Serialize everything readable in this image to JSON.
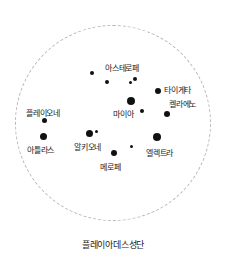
{
  "figure": {
    "caption": "플레이아데스성단",
    "background_color": "#ffffff",
    "star_color": "#111111",
    "label_color": "#1a1a1a",
    "boundary_color": "#b9b4b4"
  },
  "boundary": {
    "name": "cluster-boundary",
    "shape": "dashed-circle",
    "center_x": 113,
    "center_y": 123,
    "radius": 98
  },
  "chart_data": {
    "type": "scatter",
    "title": "플레이아데스성단",
    "xlabel": "",
    "ylabel": "",
    "grid": false,
    "legend": "none",
    "xlim": [
      0,
      226
    ],
    "ylim": [
      0,
      236
    ],
    "annotations": [
      {
        "label": "아스테로페",
        "x": 135,
        "y": 79,
        "size": 4,
        "label_x": 105,
        "label_y": 64
      },
      {
        "label": "타이게타",
        "x": 158,
        "y": 91,
        "size": 6,
        "label_x": 164,
        "label_y": 86
      },
      {
        "label": "켈라에노",
        "x": 167,
        "y": 114,
        "size": 6,
        "label_x": 169,
        "label_y": 100
      },
      {
        "label": "플레이오네",
        "x": 44,
        "y": 120,
        "size": 5,
        "label_x": 26,
        "label_y": 109
      },
      {
        "label": "아틀라스",
        "x": 43,
        "y": 136,
        "size": 7,
        "label_x": 27,
        "label_y": 146
      },
      {
        "label": "알키오네",
        "x": 89,
        "y": 133,
        "size": 7,
        "label_x": 74,
        "label_y": 143
      },
      {
        "label": "마이아",
        "x": 131,
        "y": 101,
        "size": 8,
        "label_x": 113,
        "label_y": 110
      },
      {
        "label": "메로페",
        "x": 114,
        "y": 153,
        "size": 6,
        "label_x": 100,
        "label_y": 163
      },
      {
        "label": "엘렉트라",
        "x": 157,
        "y": 137,
        "size": 8,
        "label_x": 146,
        "label_y": 149
      }
    ],
    "unlabeled_points": [
      {
        "x": 92,
        "y": 73,
        "size": 4
      },
      {
        "x": 107,
        "y": 82,
        "size": 4
      },
      {
        "x": 130,
        "y": 82,
        "size": 3
      },
      {
        "x": 142,
        "y": 111,
        "size": 4
      },
      {
        "x": 96,
        "y": 131,
        "size": 3
      },
      {
        "x": 131,
        "y": 146,
        "size": 3
      }
    ]
  }
}
